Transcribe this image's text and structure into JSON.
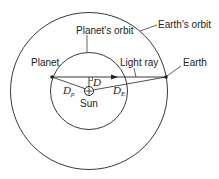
{
  "diagram": {
    "labels": {
      "earths_orbit": "Earth's orbit",
      "planets_orbit": "Planet's orbit",
      "planet": "Planet",
      "earth": "Earth",
      "light_ray": "Light ray",
      "sun": "Sun",
      "d": "D",
      "d_p": "D",
      "d_p_sub": "p",
      "d_e": "D",
      "d_e_sub": "E"
    },
    "colors": {
      "stroke": "#222222",
      "background": "#ffffff"
    }
  }
}
